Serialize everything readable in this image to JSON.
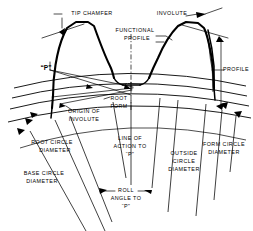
{
  "figure": {
    "type": "engineering-line-drawing",
    "background_color": "#ffffff",
    "line_color": "#000000"
  },
  "labels": {
    "tip_chamfer": "TIP CHAMFER",
    "involute": "INVOLUTE",
    "functional_line1": "FUNCTIONAL",
    "functional_line2": "PROFILE",
    "profile": "PROFILE",
    "p_point": "“P”",
    "root_form_line1": "ROOT",
    "root_form_line2": "FORM",
    "origin_line1": "ORIGIN OF",
    "origin_line2": "INVOLUTE",
    "root_circle_line1": "ROOT CIRCLE",
    "root_circle_line2": "DIAMETER",
    "base_circle_line1": "BASE  CIRCLE",
    "base_circle_line2": "DIAMETER",
    "line_of_action_line1": "LINE  OF",
    "line_of_action_line2": "ACTION TO",
    "line_of_action_line3": "“P”",
    "outside_circle_line1": "OUTSIDE",
    "outside_circle_line2": "CIRCLE",
    "outside_circle_line3": "DIAMETER",
    "form_circle_line1": "FORM  CIRCLE",
    "form_circle_line2": "DIAMETER",
    "roll_angle_line1": "ROLL",
    "roll_angle_line2": "ANGLE  TO",
    "roll_angle_line3": "“P”"
  }
}
